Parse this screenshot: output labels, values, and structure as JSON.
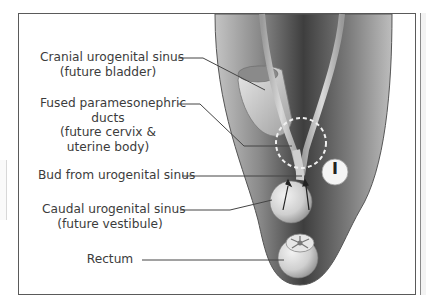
{
  "figure": {
    "stage_badge": "I",
    "highlight": "dashed circle around fused paramesonephric ducts",
    "arrows": "two upward arrows showing bud from urogenital sinus growing cranially"
  },
  "labels": [
    {
      "id": "cranial",
      "lines": [
        "Cranial urogenital sinus",
        "(future bladder)"
      ]
    },
    {
      "id": "fused",
      "lines": [
        "Fused paramesonephric",
        "ducts",
        "(future cervix &",
        "uterine body)"
      ]
    },
    {
      "id": "bud",
      "lines": [
        "Bud from urogenital sinus"
      ]
    },
    {
      "id": "caudal",
      "lines": [
        "Caudal urogenital sinus",
        "(future vestibule)"
      ]
    },
    {
      "id": "rectum",
      "lines": [
        "Rectum"
      ]
    }
  ],
  "colors": {
    "frame": "#5a5a5a",
    "body_dark": "#4a4a4a",
    "body_light": "#b8b8b8",
    "organ": "#d9d9d9",
    "leader": "#444444"
  }
}
